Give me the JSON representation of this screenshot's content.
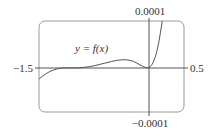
{
  "chart_data": {
    "type": "line",
    "title": "",
    "xlabel": "",
    "ylabel": "",
    "xlim": [
      -1.5,
      0.5
    ],
    "ylim": [
      -0.0001,
      0.0001
    ],
    "grid": false,
    "legend": null,
    "tick_labels": {
      "x_min": "−1.5",
      "x_max": "0.5",
      "y_max": "0.0001",
      "y_min": "−0.0001"
    },
    "annotations": [
      {
        "text": "y = f(x)",
        "x": -0.95,
        "y": 4e-05
      }
    ],
    "series": [
      {
        "name": "y = f(x)",
        "x": [
          -1.5,
          -1.4,
          -1.3,
          -1.2,
          -1.1,
          -1.0,
          -0.9,
          -0.8,
          -0.7,
          -0.6,
          -0.5,
          -0.4,
          -0.3,
          -0.2,
          -0.1,
          -0.05,
          0.0,
          0.05,
          0.1,
          0.15,
          0.2
        ],
        "y": [
          -2.5e-05,
          -1.2e-05,
          -4e-06,
          0.0,
          5e-07,
          0.0,
          8e-07,
          3e-06,
          6e-06,
          1e-05,
          1.4e-05,
          1.7e-05,
          1.8e-05,
          1.5e-05,
          6e-06,
          2e-06,
          0.0,
          4e-06,
          2e-05,
          5e-05,
          0.0001
        ]
      }
    ]
  },
  "plot": {
    "x_min_label": "−1.5",
    "x_max_label": "0.5",
    "y_max_label": "0.0001",
    "y_min_label": "−0.0001",
    "curve_label": "y = f(x)"
  }
}
